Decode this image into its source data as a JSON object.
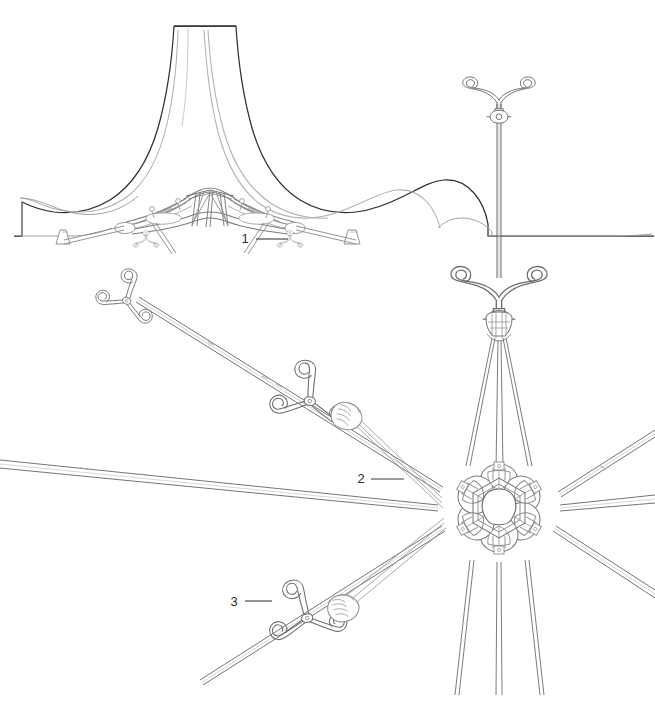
{
  "drawing": {
    "title": "Tensile membrane roof structure — mast, cable stays and star hub node",
    "type": "technical-line-drawing",
    "background_color": "#ffffff",
    "line_color_primary": "#3a3a3a",
    "line_color_secondary": "#8a8a8a",
    "line_color_light": "#b5b5b5",
    "views": [
      {
        "id": "elevation",
        "name": "membrane-roof-elevation",
        "description": "Elevation of the conical tensile membrane roof with supporting truss and splayed struts"
      },
      {
        "id": "plan",
        "name": "star-hub-node-plan",
        "description": "Plan / perspective of the six-armed star hub node with radiating cable arms and spider fittings"
      }
    ],
    "callouts": [
      {
        "id": "callout-1",
        "label": "1",
        "text_x": 245,
        "text_y": 243,
        "leader_x1": 256,
        "leader_y1": 239,
        "leader_x2": 288,
        "leader_y2": 239,
        "refers_to": "splayed-strut-foot"
      },
      {
        "id": "callout-2",
        "label": "2",
        "text_x": 361,
        "text_y": 483,
        "leader_x1": 371,
        "leader_y1": 479,
        "leader_x2": 404,
        "leader_y2": 479,
        "refers_to": "radial-cable-arm"
      },
      {
        "id": "callout-3",
        "label": "3",
        "text_x": 234,
        "text_y": 606,
        "leader_x1": 245,
        "leader_y1": 601,
        "leader_x2": 272,
        "leader_y2": 601,
        "refers_to": "three-prong-spider-fitting"
      }
    ],
    "components": {
      "mast_label": "mast",
      "fork_label": "fork-clevis-terminal",
      "hub_label": "star-hub-node",
      "spider_label": "three-prong-spider-fitting",
      "cable_label": "stay-cable",
      "membrane_label": "membrane-canopy",
      "truss_label": "space-truss",
      "strut_label": "splayed-strut"
    }
  }
}
